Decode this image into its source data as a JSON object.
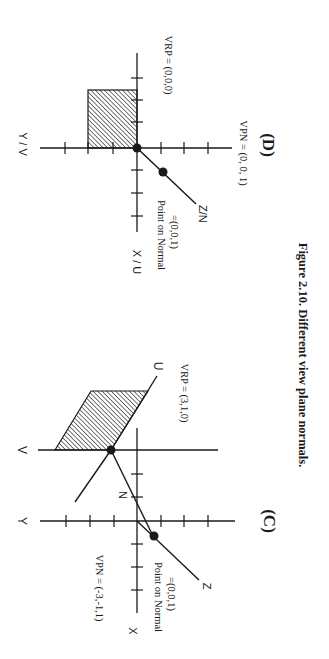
{
  "figure": {
    "caption": "Figure 2.10. Different view plane normals.",
    "ink_color": "#1a1a1a",
    "background": "#ffffff"
  },
  "panel_d": {
    "tag": "(D)",
    "horizontal_axis_label": "Y / V",
    "vertical_axis_label": "X / U",
    "normal_axis_label": "Z/N",
    "vrp_label": "VRP = (0,0,0)",
    "vpn_label": "VPN = (0, 0, 1)",
    "point_on_normal_line1": "Point on Normal",
    "point_on_normal_line2": "=(0,0,1)"
  },
  "panel_c": {
    "tag": "(C)",
    "y_axis_label": "Y",
    "x_axis_label": "X",
    "z_axis_label": "Z",
    "v_axis_label": "V",
    "u_axis_label": "U",
    "n_axis_label": "N",
    "vrp_label": "VRP = (3,1,0)",
    "vpn_label": "VPN = (-3,-1,1)",
    "point_on_normal_line1": "Point on Normal",
    "point_on_normal_line2": "=(0,0,1)"
  }
}
